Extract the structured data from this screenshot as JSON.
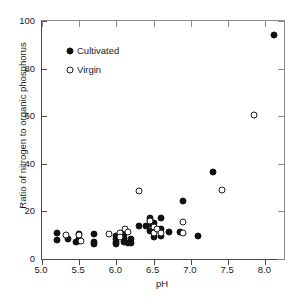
{
  "chart_data": {
    "type": "scatter",
    "title": "",
    "xlabel": "pH",
    "ylabel": "Ratio of nitrogen to organic phosphorus",
    "xlim": [
      5.0,
      8.25
    ],
    "ylim": [
      0,
      100
    ],
    "xticks": [
      5.0,
      5.5,
      6.0,
      6.5,
      7.0,
      7.5,
      8.0
    ],
    "xticklabels": [
      "5.0",
      "5.5",
      "6.0",
      "6.5",
      "7.0",
      "7.5",
      "8.0"
    ],
    "yticks": [
      0,
      20,
      40,
      60,
      80,
      100
    ],
    "yticklabels": [
      "0",
      "20",
      "40",
      "60",
      "80",
      "100"
    ],
    "grid": false,
    "legend_position": "upper left",
    "series": [
      {
        "name": "Cultivated",
        "marker": "filled-circle",
        "color": "#111111",
        "points": [
          {
            "x": 5.2,
            "y": 11.0
          },
          {
            "x": 5.2,
            "y": 8.0
          },
          {
            "x": 5.35,
            "y": 8.2
          },
          {
            "x": 5.45,
            "y": 7.0
          },
          {
            "x": 5.5,
            "y": 10.3
          },
          {
            "x": 5.5,
            "y": 8.6
          },
          {
            "x": 5.5,
            "y": 7.6
          },
          {
            "x": 5.7,
            "y": 10.4
          },
          {
            "x": 5.7,
            "y": 7.0
          },
          {
            "x": 5.7,
            "y": 6.2
          },
          {
            "x": 6.0,
            "y": 9.8
          },
          {
            "x": 6.0,
            "y": 8.6
          },
          {
            "x": 6.0,
            "y": 7.0
          },
          {
            "x": 6.0,
            "y": 6.5
          },
          {
            "x": 6.1,
            "y": 10.6
          },
          {
            "x": 6.1,
            "y": 9.0
          },
          {
            "x": 6.1,
            "y": 7.2
          },
          {
            "x": 6.15,
            "y": 6.6
          },
          {
            "x": 6.2,
            "y": 8.4
          },
          {
            "x": 6.2,
            "y": 6.9
          },
          {
            "x": 6.3,
            "y": 13.8
          },
          {
            "x": 6.4,
            "y": 14.0
          },
          {
            "x": 6.45,
            "y": 16.4
          },
          {
            "x": 6.45,
            "y": 17.3
          },
          {
            "x": 6.45,
            "y": 14.8
          },
          {
            "x": 6.45,
            "y": 11.6
          },
          {
            "x": 6.5,
            "y": 15.2
          },
          {
            "x": 6.5,
            "y": 11.8
          },
          {
            "x": 6.5,
            "y": 9.2
          },
          {
            "x": 6.6,
            "y": 17.2
          },
          {
            "x": 6.6,
            "y": 12.6
          },
          {
            "x": 6.6,
            "y": 9.6
          },
          {
            "x": 6.7,
            "y": 11.4
          },
          {
            "x": 6.85,
            "y": 11.4
          },
          {
            "x": 6.9,
            "y": 24.2
          },
          {
            "x": 7.1,
            "y": 9.8
          },
          {
            "x": 7.3,
            "y": 36.6
          },
          {
            "x": 8.12,
            "y": 94.0
          }
        ]
      },
      {
        "name": "Virgin",
        "marker": "open-circle",
        "color": "#1a1a1a",
        "points": [
          {
            "x": 5.32,
            "y": 10.2
          },
          {
            "x": 5.5,
            "y": 10.0
          },
          {
            "x": 5.52,
            "y": 7.6
          },
          {
            "x": 5.9,
            "y": 10.4
          },
          {
            "x": 6.05,
            "y": 11.0
          },
          {
            "x": 6.05,
            "y": 9.4
          },
          {
            "x": 6.12,
            "y": 12.8
          },
          {
            "x": 6.15,
            "y": 11.2
          },
          {
            "x": 6.3,
            "y": 28.4
          },
          {
            "x": 6.45,
            "y": 16.0
          },
          {
            "x": 6.5,
            "y": 13.4
          },
          {
            "x": 6.5,
            "y": 11.0
          },
          {
            "x": 6.55,
            "y": 12.4
          },
          {
            "x": 6.6,
            "y": 11.0
          },
          {
            "x": 6.9,
            "y": 15.4
          },
          {
            "x": 6.9,
            "y": 10.8
          },
          {
            "x": 7.42,
            "y": 29.0
          },
          {
            "x": 7.85,
            "y": 60.6
          }
        ]
      }
    ]
  },
  "legend": {
    "items": [
      {
        "label": "Cultivated",
        "marker": "filled-circle"
      },
      {
        "label": "Virgin",
        "marker": "open-circle"
      }
    ]
  }
}
